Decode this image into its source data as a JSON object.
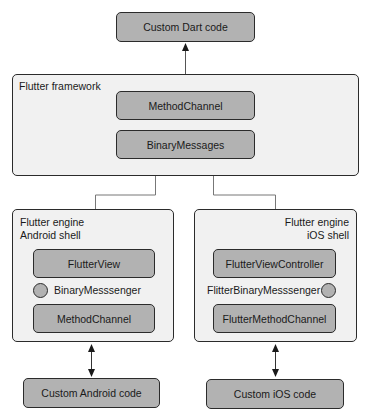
{
  "diagram": {
    "top": {
      "custom_dart": "Custom Dart code"
    },
    "framework": {
      "label": "Flutter framework",
      "method_channel": "MethodChannel",
      "binary_messages": "BinaryMessages"
    },
    "android": {
      "label_line1": "Flutter engine",
      "label_line2": "Android shell",
      "view": "FlutterView",
      "messenger": "BinaryMesssenger",
      "channel": "MethodChannel",
      "custom": "Custom Android code"
    },
    "ios": {
      "label_line1": "Flutter engine",
      "label_line2": "iOS shell",
      "view": "FlutterViewController",
      "messenger": "FlitterBinaryMesssenger",
      "channel": "FlutterMethodChannel",
      "custom": "Custom iOS code"
    },
    "colors": {
      "component_fill": "#b2b2b2",
      "panel_fill": "#f1f1f1",
      "stroke": "#2b2b2b",
      "connector": "#7a7a7a"
    }
  }
}
